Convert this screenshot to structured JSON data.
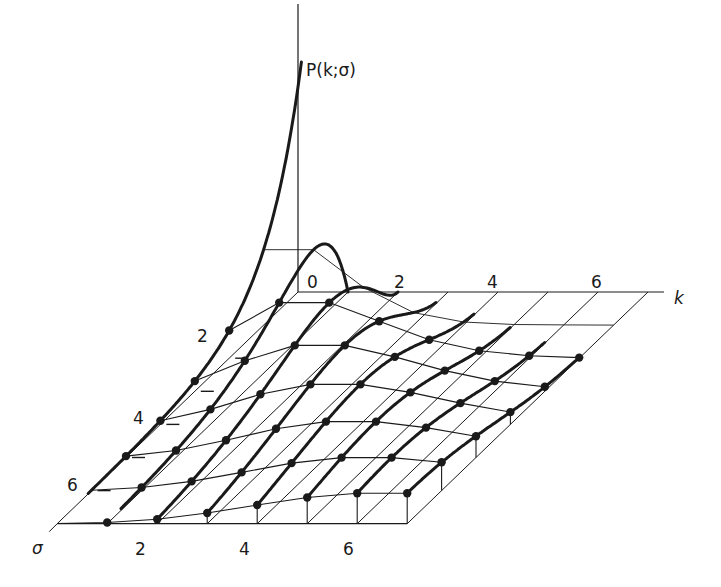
{
  "figure": {
    "z_axis_label": "P(k;σ)",
    "x_axis_label": "k",
    "y_axis_label": "σ",
    "k_tick_labels": [
      "0",
      "2",
      "4",
      "6"
    ],
    "sigma_side_tick_labels": [
      "2",
      "4",
      "6"
    ],
    "front_tick_labels": [
      "2",
      "4",
      "6"
    ],
    "ink_color": "#1a1a1a",
    "background": "#ffffff"
  },
  "chart_data": {
    "type": "surface",
    "title": "",
    "function": "P(k;σ) = σ^k e^(−σ) / k!",
    "xlabel": "k",
    "ylabel": "σ",
    "zlabel": "P(k;σ)",
    "k_range": [
      0,
      7
    ],
    "sigma_range": [
      0,
      7
    ],
    "k_ticks": [
      0,
      2,
      4,
      6
    ],
    "sigma_ticks": [
      2,
      4,
      6
    ],
    "front_ticks": [
      2,
      4,
      6
    ],
    "grid": true,
    "k_values": [
      0,
      1,
      2,
      3,
      4,
      5,
      6,
      7
    ],
    "sigma_values": [
      1,
      2,
      3,
      4,
      5,
      6,
      7
    ],
    "series": [
      {
        "name": "σ=1",
        "values": [
          0.368,
          0.368,
          0.184,
          0.061,
          0.015,
          0.003,
          0.001,
          0.0
        ]
      },
      {
        "name": "σ=2",
        "values": [
          0.135,
          0.271,
          0.271,
          0.18,
          0.09,
          0.036,
          0.012,
          0.003
        ]
      },
      {
        "name": "σ=3",
        "values": [
          0.05,
          0.149,
          0.224,
          0.224,
          0.168,
          0.101,
          0.05,
          0.022
        ]
      },
      {
        "name": "σ=4",
        "values": [
          0.018,
          0.073,
          0.147,
          0.195,
          0.195,
          0.156,
          0.104,
          0.06
        ]
      },
      {
        "name": "σ=5",
        "values": [
          0.007,
          0.034,
          0.084,
          0.14,
          0.175,
          0.175,
          0.146,
          0.104
        ]
      },
      {
        "name": "σ=6",
        "values": [
          0.002,
          0.015,
          0.045,
          0.089,
          0.134,
          0.161,
          0.161,
          0.138
        ]
      },
      {
        "name": "σ=7",
        "values": [
          0.001,
          0.006,
          0.022,
          0.052,
          0.091,
          0.128,
          0.149,
          0.149
        ]
      }
    ],
    "dot_sigma_rows": [
      2,
      3,
      4,
      5,
      6,
      7
    ]
  }
}
